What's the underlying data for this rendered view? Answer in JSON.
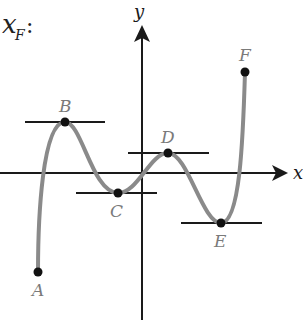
{
  "diagram": {
    "title_label": "x",
    "title_sub": "F",
    "title_colon": ":",
    "axes": {
      "x_label": "x",
      "y_label": "y"
    },
    "points": [
      {
        "name": "A",
        "x": 38,
        "y": 272
      },
      {
        "name": "B",
        "x": 65,
        "y": 122
      },
      {
        "name": "C",
        "x": 118,
        "y": 193
      },
      {
        "name": "D",
        "x": 168,
        "y": 153
      },
      {
        "name": "E",
        "x": 221,
        "y": 223
      },
      {
        "name": "F",
        "x": 245,
        "y": 72
      }
    ],
    "tangent_lines": [
      {
        "at": "B",
        "x1": 25,
        "x2": 105,
        "y": 122
      },
      {
        "at": "C",
        "x1": 76,
        "x2": 157,
        "y": 193
      },
      {
        "at": "D",
        "x1": 128,
        "x2": 209,
        "y": 153
      },
      {
        "at": "E",
        "x1": 181,
        "x2": 262,
        "y": 223
      }
    ],
    "colors": {
      "curve": "#8a8a8a",
      "axis": "#1a1a1a",
      "point": "#111111",
      "label": "#7a7a7a"
    }
  }
}
